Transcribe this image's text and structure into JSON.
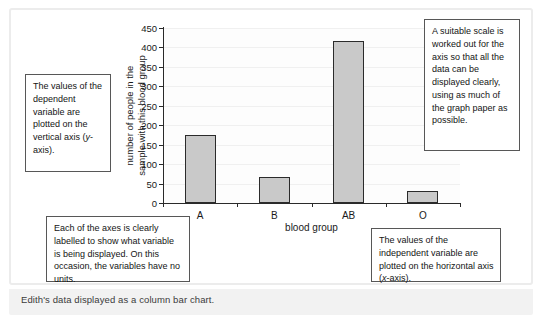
{
  "caption": "Edith's data displayed as a column bar chart.",
  "chart_data": {
    "type": "bar",
    "title": "",
    "categories": [
      "A",
      "B",
      "AB",
      "O"
    ],
    "values": [
      175,
      67,
      417,
      30
    ],
    "xlabel": "blood group",
    "ylabel": "number of people in the sample with this blood group",
    "ylabel_line1": "number of people in the",
    "ylabel_line2": "sample with this blood group",
    "ylim": [
      0,
      450
    ],
    "ytick_interval": 50,
    "yticks": [
      0,
      50,
      100,
      150,
      200,
      250,
      300,
      350,
      400,
      450
    ],
    "ytick_labels": [
      "0",
      "50",
      "100",
      "150",
      "200",
      "250",
      "300",
      "350",
      "400",
      "450"
    ],
    "grid": true,
    "legend": false,
    "bar_fill_color": "#c9c9c9",
    "bar_edge_color": "#2b2b2b",
    "axis_color": "#2a2a2a"
  },
  "annotations": {
    "dependent": "The values of the dependent variable are plotted on the vertical axis (y-axis).",
    "scale": "A suitable scale is worked out for the axis so that all the data can be displayed clearly, using as much of the graph paper as possible.",
    "axes_labelled": "Each of the axes is clearly labelled to show what variable is being displayed. On this occasion, the variables have no units.",
    "independent": "The values of the independent variable are plotted on the horizontal axis (x-axis)."
  }
}
